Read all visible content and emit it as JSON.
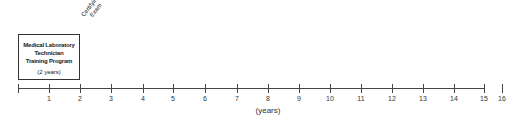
{
  "program_box": {
    "title_lines": [
      "Medical Laboratory",
      "Technician",
      "Training Program"
    ],
    "duration": "(2 years)"
  },
  "milestone": {
    "lines": [
      "Certifying",
      "Exam"
    ],
    "at_year": 2
  },
  "axis": {
    "label": "(years)",
    "ticks": [
      "",
      "1",
      "2",
      "3",
      "4",
      "5",
      "6",
      "7",
      "8",
      "9",
      "10",
      "11",
      "12",
      "13",
      "14",
      "15",
      "16"
    ],
    "tick_x": [
      18,
      49,
      80,
      111,
      143,
      173,
      205,
      237,
      268,
      299,
      330,
      361,
      392,
      423,
      454,
      484,
      502
    ]
  }
}
